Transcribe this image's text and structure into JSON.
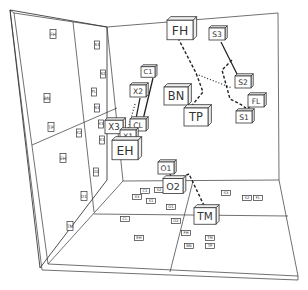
{
  "diagram": {
    "type": "3d-scatter-room",
    "cubes": [
      {
        "label": "FH",
        "x": 180,
        "y": 30,
        "s": 13
      },
      {
        "label": "S3",
        "x": 217,
        "y": 34,
        "s": 8
      },
      {
        "label": "C1",
        "x": 148,
        "y": 72,
        "s": 7
      },
      {
        "label": "X2",
        "x": 138,
        "y": 91,
        "s": 8
      },
      {
        "label": "BN",
        "x": 176,
        "y": 96,
        "s": 12
      },
      {
        "label": "S2",
        "x": 243,
        "y": 82,
        "s": 8
      },
      {
        "label": "FL",
        "x": 256,
        "y": 101,
        "s": 8
      },
      {
        "label": "S1",
        "x": 244,
        "y": 117,
        "s": 8
      },
      {
        "label": "TP",
        "x": 196,
        "y": 117,
        "s": 12
      },
      {
        "label": "X3",
        "x": 114,
        "y": 127,
        "s": 9
      },
      {
        "label": "CL",
        "x": 138,
        "y": 125,
        "s": 8
      },
      {
        "label": "X1",
        "x": 128,
        "y": 136,
        "s": 8
      },
      {
        "label": "EH",
        "x": 125,
        "y": 150,
        "s": 13
      },
      {
        "label": "O1",
        "x": 166,
        "y": 168,
        "s": 8
      },
      {
        "label": "O2",
        "x": 173,
        "y": 186,
        "s": 10
      },
      {
        "label": "TM",
        "x": 205,
        "y": 216,
        "s": 11
      }
    ],
    "back_wall_projections": [
      {
        "label": "FH",
        "x": 53,
        "y": 34
      },
      {
        "label": "BN",
        "x": 47,
        "y": 98
      },
      {
        "label": "TP",
        "x": 51,
        "y": 127
      },
      {
        "label": "EH",
        "x": 63,
        "y": 158
      },
      {
        "label": "O1",
        "x": 84,
        "y": 196
      },
      {
        "label": "TM",
        "x": 70,
        "y": 226
      }
    ],
    "side_wall_projections": [
      {
        "label": "S3",
        "x": 97,
        "y": 45
      },
      {
        "label": "S2",
        "x": 103,
        "y": 74
      },
      {
        "label": "FL",
        "x": 94,
        "y": 92
      },
      {
        "label": "S1",
        "x": 97,
        "y": 108
      },
      {
        "label": "X2",
        "x": 79,
        "y": 133
      },
      {
        "label": "X3",
        "x": 101,
        "y": 124
      },
      {
        "label": "X1",
        "x": 102,
        "y": 140
      },
      {
        "label": "CL",
        "x": 108,
        "y": 127
      },
      {
        "label": "O2",
        "x": 96,
        "y": 172
      }
    ],
    "floor_projections": [
      {
        "label": "C1",
        "x": 145,
        "y": 191
      },
      {
        "label": "X2",
        "x": 159,
        "y": 190
      },
      {
        "label": "X3",
        "x": 137,
        "y": 197
      },
      {
        "label": "X1",
        "x": 151,
        "y": 201
      },
      {
        "label": "O1",
        "x": 171,
        "y": 207
      },
      {
        "label": "CL",
        "x": 125,
        "y": 219
      },
      {
        "label": "O2",
        "x": 176,
        "y": 221
      },
      {
        "label": "EH",
        "x": 139,
        "y": 238
      },
      {
        "label": "FH",
        "x": 186,
        "y": 233
      },
      {
        "label": "BN",
        "x": 189,
        "y": 246
      },
      {
        "label": "TP",
        "x": 210,
        "y": 246
      },
      {
        "label": "TM",
        "x": 210,
        "y": 238
      },
      {
        "label": "S3",
        "x": 226,
        "y": 193
      },
      {
        "label": "S2",
        "x": 247,
        "y": 198
      },
      {
        "label": "FL",
        "x": 258,
        "y": 198
      }
    ]
  }
}
